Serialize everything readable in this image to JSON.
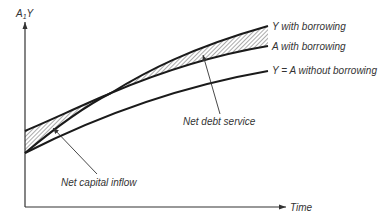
{
  "diagram": {
    "y_axis_label": "A",
    "y_axis_label_subscript": "1",
    "y_axis_label_suffix": "Y",
    "x_axis_label": "Time",
    "curves": [
      {
        "id": "y-with-borrowing",
        "label": "Y with borrowing"
      },
      {
        "id": "a-with-borrowing",
        "label": "A with borrowing"
      },
      {
        "id": "y-equals-a-without-borrowing",
        "label": "Y = A without borrowing"
      }
    ],
    "annotations": [
      {
        "id": "net-debt-service",
        "label": "Net debt service"
      },
      {
        "id": "net-capital-inflow",
        "label": "Net capital inflow"
      }
    ],
    "colors": {
      "line": "#1a1a1a",
      "axis": "#333333",
      "text": "#333333",
      "hatch": "#444444"
    }
  }
}
